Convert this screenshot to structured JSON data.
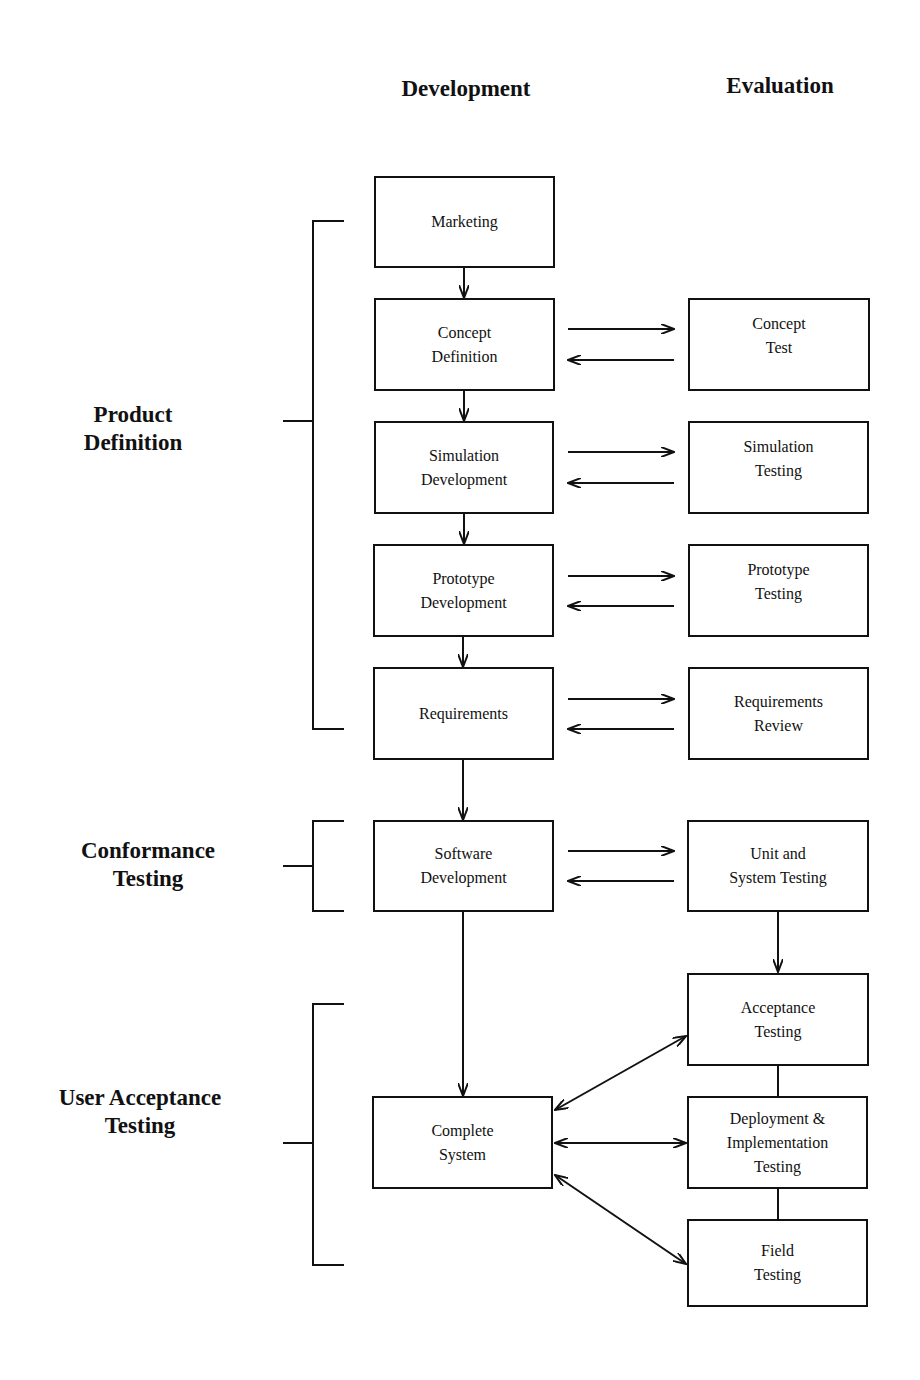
{
  "columns": {
    "development": "Development",
    "evaluation": "Evaluation"
  },
  "phases": [
    {
      "id": "product-definition",
      "line1": "Product",
      "line2": "Definition"
    },
    {
      "id": "conformance-testing",
      "line1": "Conformance",
      "line2": "Testing"
    },
    {
      "id": "user-acceptance-testing",
      "line1": "User Acceptance",
      "line2": "Testing"
    }
  ],
  "development_boxes": [
    {
      "id": "marketing",
      "lines": [
        "Marketing"
      ]
    },
    {
      "id": "concept-definition",
      "lines": [
        "Concept",
        "Definition"
      ]
    },
    {
      "id": "simulation-development",
      "lines": [
        "Simulation",
        "Development"
      ]
    },
    {
      "id": "prototype-development",
      "lines": [
        "Prototype",
        "Development"
      ]
    },
    {
      "id": "requirements",
      "lines": [
        "Requirements"
      ]
    },
    {
      "id": "software-development",
      "lines": [
        "Software",
        "Development"
      ]
    },
    {
      "id": "complete-system",
      "lines": [
        "Complete",
        "System"
      ]
    }
  ],
  "evaluation_boxes": [
    {
      "id": "concept-test",
      "lines": [
        "Concept",
        "Test"
      ]
    },
    {
      "id": "simulation-testing",
      "lines": [
        "Simulation",
        "Testing"
      ]
    },
    {
      "id": "prototype-testing",
      "lines": [
        "Prototype",
        "Testing"
      ]
    },
    {
      "id": "requirements-review",
      "lines": [
        "Requirements",
        "Review"
      ]
    },
    {
      "id": "unit-system-testing",
      "lines": [
        "Unit and",
        "System Testing"
      ]
    },
    {
      "id": "acceptance-testing",
      "lines": [
        "Acceptance",
        "Testing"
      ]
    },
    {
      "id": "deployment-implementation-testing",
      "lines": [
        "Deployment &",
        "Implementation",
        "Testing"
      ]
    },
    {
      "id": "field-testing",
      "lines": [
        "Field",
        "Testing"
      ]
    }
  ]
}
